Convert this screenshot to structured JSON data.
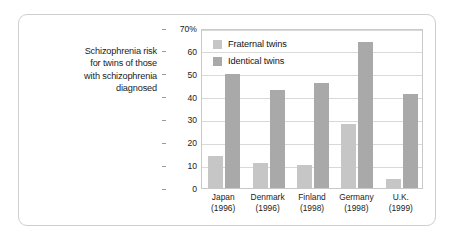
{
  "caption": {
    "lines": [
      "Schizophrenia risk",
      "for twins of those",
      "with schizophrenia",
      "diagnosed"
    ]
  },
  "legend": {
    "items": [
      {
        "label": "Fraternal twins",
        "color": "#c6c6c6"
      },
      {
        "label": "Identical twins",
        "color": "#a9a9a9"
      }
    ]
  },
  "axis": {
    "y_ticks": [
      "70%",
      "60",
      "50",
      "40",
      "30",
      "20",
      "10",
      "0"
    ]
  },
  "categories": [
    {
      "name": "Japan",
      "year": "(1996)"
    },
    {
      "name": "Denmark",
      "year": "(1996)"
    },
    {
      "name": "Finland",
      "year": "(1998)"
    },
    {
      "name": "Germany",
      "year": "(1998)"
    },
    {
      "name": "U.K.",
      "year": "(1999)"
    }
  ],
  "chart_data": {
    "type": "bar",
    "title": "Schizophrenia risk for twins of those with schizophrenia diagnosed",
    "xlabel": "",
    "ylabel": "",
    "ylim": [
      0,
      70
    ],
    "yticks": [
      0,
      10,
      20,
      30,
      40,
      50,
      60,
      70
    ],
    "ytick_labels": [
      "0",
      "10",
      "20",
      "30",
      "40",
      "50",
      "60",
      "70%"
    ],
    "grid": true,
    "legend_position": "inside-top-left",
    "categories": [
      "Japan (1996)",
      "Denmark (1996)",
      "Finland (1998)",
      "Germany (1998)",
      "U.K. (1999)"
    ],
    "series": [
      {
        "name": "Fraternal twins",
        "color": "#c6c6c6",
        "values": [
          14,
          11,
          10,
          28,
          4
        ]
      },
      {
        "name": "Identical twins",
        "color": "#a9a9a9",
        "values": [
          50,
          43,
          46,
          64,
          41
        ]
      }
    ]
  }
}
